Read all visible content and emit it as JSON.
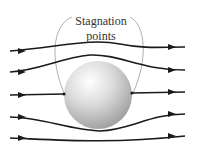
{
  "diagram": {
    "label_line1": "Stagnation",
    "label_line2": "points",
    "colors": {
      "streamline": "#1a1a1a",
      "sphere_light": "#f4f4f4",
      "sphere_dark": "#a8a8a8",
      "callout": "#9a9a9a"
    },
    "streamline_count": 5,
    "elements": [
      "sphere",
      "streamlines",
      "arrowheads",
      "stagnation-point-callout"
    ]
  }
}
